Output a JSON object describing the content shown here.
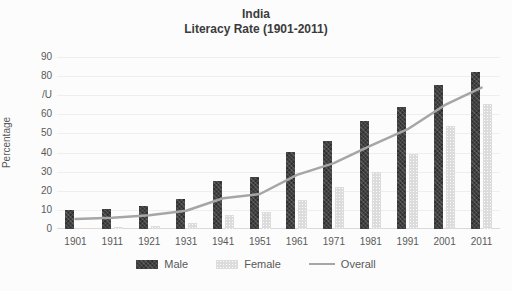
{
  "title": {
    "line1": "India",
    "line2": "Literacy Rate (1901-2011)"
  },
  "y_axis": {
    "label": "Percentage",
    "min": 0,
    "max": 90,
    "step": 10,
    "tick_labels": [
      "0",
      "10",
      "20",
      "30",
      "40",
      "50",
      "60",
      "/U",
      "80",
      "90"
    ]
  },
  "x_axis": {
    "tick_labels": [
      "1901",
      "1911",
      "1921",
      "1931",
      "1941",
      "1951",
      "1961",
      "1971",
      "1981",
      "1991",
      "2001",
      "2011"
    ]
  },
  "legend": {
    "items": [
      {
        "label": "Male",
        "swatch": "bar",
        "color": "#414141"
      },
      {
        "label": "Female",
        "swatch": "bar",
        "color": "#dcdcdc"
      },
      {
        "label": "Overall",
        "swatch": "line",
        "color": "#a6a6a6"
      }
    ]
  },
  "colors": {
    "male_bar": "#414141",
    "female_bar": "#dcdcdc",
    "overall_line": "#a6a6a6",
    "gridline": "#eeeeee",
    "axis_text": "#595959",
    "title_text": "#3b3b3b",
    "background": "#fcfcfc"
  },
  "chart_data": {
    "type": "bar",
    "title": "India",
    "subtitle": "Literacy Rate (1901-2011)",
    "xlabel": "",
    "ylabel": "Percentage",
    "ylim": [
      0,
      90
    ],
    "grid": true,
    "legend_position": "bottom",
    "categories": [
      "1901",
      "1911",
      "1921",
      "1931",
      "1941",
      "1951",
      "1961",
      "1971",
      "1981",
      "1991",
      "2001",
      "2011"
    ],
    "series": [
      {
        "name": "Male",
        "type": "bar",
        "color": "#414141",
        "values": [
          9.8,
          10.6,
          12.2,
          15.6,
          24.9,
          27.2,
          40.4,
          46.0,
          56.4,
          64.1,
          75.3,
          82.1
        ]
      },
      {
        "name": "Female",
        "type": "bar",
        "color": "#dcdcdc",
        "values": [
          0.6,
          1.0,
          1.8,
          2.9,
          7.3,
          8.9,
          15.4,
          22.0,
          29.8,
          39.3,
          53.7,
          65.5
        ]
      },
      {
        "name": "Overall",
        "type": "line",
        "color": "#a6a6a6",
        "values": [
          5.3,
          5.9,
          7.2,
          9.5,
          16.1,
          18.3,
          28.3,
          34.5,
          43.6,
          52.2,
          64.8,
          74.0
        ]
      }
    ]
  }
}
